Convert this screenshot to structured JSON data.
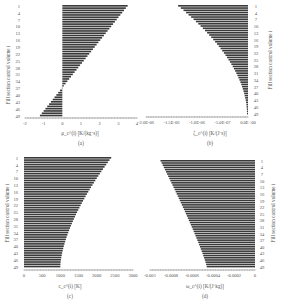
{
  "chart_data": [
    {
      "id": "a",
      "type": "bar",
      "orientation": "horizontal",
      "caption": "(a)",
      "xlabel": "μ_c^(i) [K/(kg·s)]",
      "ylabel": "Fill section control volume i",
      "ylabel_side": "left",
      "xlim": [
        -2,
        4
      ],
      "xticks": [
        -2,
        -1,
        0,
        1,
        2,
        3,
        4
      ],
      "xtick_labels": [
        "-2",
        "-1",
        "0",
        "1",
        "2",
        "3",
        "4"
      ],
      "row_tick_labels": [
        "1",
        "4",
        "7",
        "10",
        "13",
        "16",
        "19",
        "22",
        "25",
        "28",
        "31",
        "34",
        "37",
        "40",
        "43",
        "46",
        "49"
      ],
      "n_rows": 49,
      "value_start": 3.5,
      "value_end": -1.2,
      "shape": "linear",
      "grid": false
    },
    {
      "id": "b",
      "type": "bar",
      "orientation": "horizontal",
      "caption": "(b)",
      "xlabel": "ζ_c^(i) [K/(J·s)]",
      "ylabel": "Fill section control volume i",
      "ylabel_side": "right",
      "xlim": [
        -2e-06,
        0
      ],
      "xticks": [
        -2e-06,
        -1.5e-06,
        -1e-06,
        -5e-07,
        0
      ],
      "xtick_labels": [
        "-2.0E-06",
        "-1.5E-06",
        "-1.0E-06",
        "-5.0E-07",
        "0.0E+00"
      ],
      "row_tick_labels": [
        "1",
        "4",
        "7",
        "10",
        "13",
        "16",
        "19",
        "22",
        "25",
        "28",
        "31",
        "34",
        "37",
        "40",
        "43",
        "46",
        "49"
      ],
      "n_rows": 49,
      "value_start": -1.37e-06,
      "value_end": -2e-08,
      "shape": "convex",
      "grid": false
    },
    {
      "id": "c",
      "type": "bar",
      "orientation": "horizontal",
      "caption": "(c)",
      "xlabel": "c_c^(i) [K]",
      "ylabel": "Fill section control volume i",
      "ylabel_side": "left",
      "xlim": [
        0,
        3000
      ],
      "xticks": [
        0,
        500,
        1000,
        1500,
        2000,
        2500,
        3000
      ],
      "xtick_labels": [
        "0",
        "500",
        "1000",
        "1500",
        "2000",
        "2500",
        "3000"
      ],
      "row_tick_labels": [
        "1",
        "4",
        "7",
        "10",
        "13",
        "16",
        "19",
        "22",
        "25",
        "28",
        "31",
        "34",
        "37",
        "40",
        "43",
        "46",
        "49"
      ],
      "n_rows": 49,
      "value_start": 2400,
      "value_end": 1000,
      "shape": "concave",
      "grid": false
    },
    {
      "id": "d",
      "type": "bar",
      "orientation": "horizontal",
      "caption": "(d)",
      "xlabel": "ω_c^(i) [K/(J·kg)]",
      "ylabel": "Fill section control volume i",
      "ylabel_side": "right",
      "xlim": [
        -0.001,
        0
      ],
      "xticks": [
        -0.001,
        -0.0008,
        -0.0006,
        -0.0004,
        -0.0002,
        0
      ],
      "xtick_labels": [
        "-0.001",
        "-0.0008",
        "-0.0006",
        "-0.0004",
        "-0.0002",
        "0"
      ],
      "row_tick_labels": [
        "1",
        "4",
        "7",
        "10",
        "13",
        "16",
        "19",
        "22",
        "25",
        "28",
        "31",
        "34",
        "37",
        "40",
        "43",
        "46",
        "49"
      ],
      "n_rows": 49,
      "value_start": -0.0009,
      "value_end": -0.00046,
      "shape": "slightly-concave",
      "grid": false
    }
  ]
}
